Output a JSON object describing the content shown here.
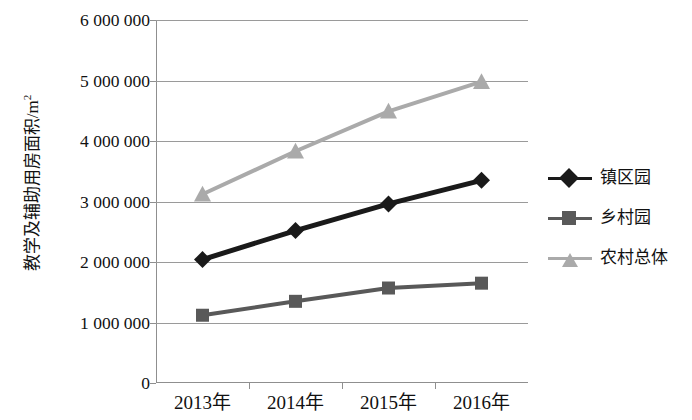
{
  "chart": {
    "type": "line",
    "ylabel_text": "教学及辅助用房面积/m",
    "ylabel_unit_sup": "2",
    "xlabel": ""
  },
  "chart_data": {
    "type": "line",
    "title": "",
    "xlabel": "",
    "ylabel": "教学及辅助用房面积/m²",
    "categories": [
      "2013年",
      "2014年",
      "2015年",
      "2016年"
    ],
    "ylim": [
      0,
      6000000
    ],
    "ytick_values": [
      0,
      1000000,
      2000000,
      3000000,
      4000000,
      5000000,
      6000000
    ],
    "ytick_labels": [
      "0",
      "1 000 000",
      "2 000 000",
      "3 000 000",
      "4 000 000",
      "5 000 000",
      "6 000 000"
    ],
    "grid": true,
    "legend_position": "right",
    "series": [
      {
        "name": "镇区园",
        "marker": "diamond",
        "color": "#1a1a1a",
        "values": [
          2040000,
          2520000,
          2960000,
          3350000
        ]
      },
      {
        "name": "乡村园",
        "marker": "square",
        "color": "#595959",
        "values": [
          1120000,
          1350000,
          1570000,
          1650000
        ]
      },
      {
        "name": "农村总体",
        "marker": "triangle",
        "color": "#aaaaaa",
        "values": [
          3120000,
          3830000,
          4490000,
          4980000
        ]
      }
    ]
  }
}
